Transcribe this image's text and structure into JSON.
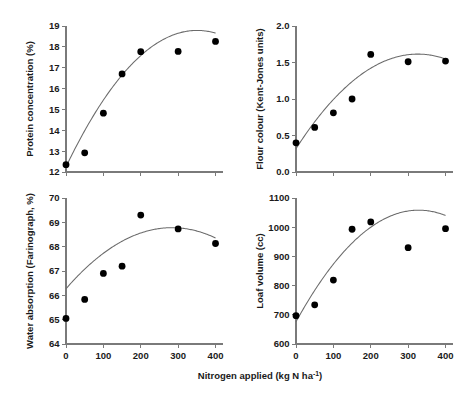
{
  "figure": {
    "background_color": "#ffffff",
    "point_color": "#000000",
    "curve_color": "#6b6b6b",
    "axis_color": "#7a7a7a",
    "shared_xlabel": "Nitrogen applied (kg N ha-1)",
    "shared_xlabel_sup": "-1",
    "shared_xlabel_prefix": "Nitrogen applied (kg N ha",
    "shared_xlabel_suffix": ")"
  },
  "chart_data": [
    {
      "type": "scatter",
      "panel": "top-left",
      "title": "",
      "xlabel": "Nitrogen applied (kg N ha-1)",
      "ylabel": "Protein concentration (%)",
      "xlim": [
        0,
        420
      ],
      "ylim": [
        12,
        19
      ],
      "xticks": [
        0,
        100,
        200,
        300,
        400
      ],
      "xticklabels": [
        "",
        "",
        "",
        "",
        ""
      ],
      "yticks": [
        12,
        13,
        14,
        15,
        16,
        17,
        18,
        19
      ],
      "yticklabels": [
        "12",
        "13",
        "14",
        "15",
        "16",
        "17",
        "18",
        "19"
      ],
      "grid": false,
      "legend": "none",
      "x": [
        0,
        50,
        100,
        150,
        200,
        300,
        400
      ],
      "values": [
        12.35,
        12.92,
        14.82,
        16.7,
        17.77,
        17.78,
        18.26
      ],
      "fit": {
        "kind": "quadratic",
        "a": -5.32e-05,
        "b": 0.0373,
        "c": 12.25,
        "x_start": 0,
        "x_end": 400
      }
    },
    {
      "type": "scatter",
      "panel": "top-right",
      "title": "",
      "xlabel": "Nitrogen applied (kg N ha-1)",
      "ylabel": "Flour colour (Kent-Jones units)",
      "xlim": [
        0,
        420
      ],
      "ylim": [
        0.0,
        2.0
      ],
      "xticks": [
        0,
        100,
        200,
        300,
        400
      ],
      "xticklabels": [
        "",
        "",
        "",
        "",
        ""
      ],
      "yticks": [
        0.0,
        0.5,
        1.0,
        1.5,
        2.0
      ],
      "yticklabels": [
        "0.0",
        "0.5",
        "1.0",
        "1.5",
        "2.0"
      ],
      "grid": false,
      "legend": "none",
      "x": [
        0,
        50,
        100,
        150,
        200,
        300,
        400
      ],
      "values": [
        0.4,
        0.61,
        0.81,
        1.0,
        1.61,
        1.51,
        1.52
      ],
      "fit": {
        "kind": "quadratic",
        "a": -1.22e-05,
        "b": 0.00795,
        "c": 0.32,
        "x_start": 0,
        "x_end": 400
      }
    },
    {
      "type": "scatter",
      "panel": "bottom-left",
      "title": "",
      "xlabel": "Nitrogen applied (kg N ha-1)",
      "ylabel": "Water absorption (Farinograph, %)",
      "xlim": [
        0,
        420
      ],
      "ylim": [
        64,
        70
      ],
      "xticks": [
        0,
        100,
        200,
        300,
        400
      ],
      "xticklabels": [
        "0",
        "100",
        "200",
        "300",
        "400"
      ],
      "yticks": [
        64,
        65,
        66,
        67,
        68,
        69,
        70
      ],
      "yticklabels": [
        "64",
        "65",
        "66",
        "67",
        "68",
        "69",
        "70"
      ],
      "grid": false,
      "legend": "none",
      "x": [
        0,
        50,
        100,
        150,
        200,
        300,
        400
      ],
      "values": [
        65.05,
        65.83,
        66.9,
        67.2,
        69.3,
        68.73,
        68.13
      ],
      "fit": {
        "kind": "quadratic",
        "a": -3.12e-05,
        "b": 0.0177,
        "c": 66.27,
        "x_start": 0,
        "x_end": 400
      }
    },
    {
      "type": "scatter",
      "panel": "bottom-right",
      "title": "",
      "xlabel": "Nitrogen applied (kg N ha-1)",
      "ylabel": "Loaf volume (cc)",
      "xlim": [
        0,
        420
      ],
      "ylim": [
        600,
        1100
      ],
      "xticks": [
        0,
        100,
        200,
        300,
        400
      ],
      "xticklabels": [
        "0",
        "100",
        "200",
        "300",
        "400"
      ],
      "yticks": [
        600,
        700,
        800,
        900,
        1000,
        1100
      ],
      "yticklabels": [
        "600",
        "700",
        "800",
        "900",
        "1000",
        "1100"
      ],
      "grid": false,
      "legend": "none",
      "x": [
        0,
        50,
        100,
        150,
        200,
        300,
        400
      ],
      "values": [
        697,
        734,
        819,
        993,
        1018,
        930,
        995
      ],
      "fit": {
        "kind": "quadratic",
        "a": -0.00355,
        "b": 2.33,
        "c": 676,
        "x_start": 0,
        "x_end": 400
      }
    }
  ]
}
